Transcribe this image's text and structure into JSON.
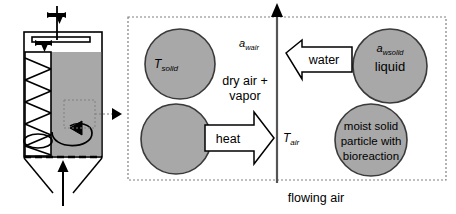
{
  "figure": {
    "type": "process-schematic",
    "bottom_caption": "flowing air"
  },
  "colors": {
    "particle_fill": "#a8a8a8",
    "vessel_fill": "#a8a8a8",
    "stroke": "#000000",
    "callout_dotted": "#808080",
    "panel_border": "#808080",
    "background": "#ffffff"
  },
  "vessel": {
    "name": "bioreactor-vessel",
    "has_screw_auger": true,
    "has_top_stirrer_arm": true,
    "has_conical_hopper": true,
    "has_air_inlet_arrow": true,
    "callout_box_label": "",
    "icons": [
      {
        "name": "motor-drive-icon",
        "position": "top-shaft"
      },
      {
        "name": "motor-drive-icon",
        "position": "arm-left-end"
      },
      {
        "name": "mixing-direction-arrow-icon",
        "position": "vessel-interior"
      },
      {
        "name": "callout-pointer-icon",
        "position": "right-of-vessel"
      },
      {
        "name": "air-inlet-arrow-icon",
        "position": "below-hopper"
      }
    ]
  },
  "panel": {
    "name": "magnified-transfer-panel",
    "border_style": "dotted",
    "axis": {
      "name": "flowing-air-axis",
      "orientation": "vertical",
      "arrow_direction": "up",
      "top_label": "a",
      "top_label_sub": "wair",
      "bottom_label": "T",
      "bottom_label_sub": "air"
    },
    "center_text": {
      "line1": "dry air +",
      "line2": "vapor"
    },
    "particles": [
      {
        "name": "particle-top-left",
        "label": "T",
        "label_sub": "solid",
        "label_style": "italic",
        "side": "left"
      },
      {
        "name": "particle-bottom-left",
        "label": "",
        "label_sub": "",
        "label_style": "none",
        "side": "left"
      },
      {
        "name": "particle-top-right-liquid",
        "label": "a",
        "label_sub": "wsolid",
        "label_style": "italic",
        "caption": "liquid",
        "side": "right"
      },
      {
        "name": "particle-bottom-right-moist-solid",
        "label": "",
        "label_sub": "",
        "caption_lines": [
          "moist solid",
          "particle with",
          "bioreaction"
        ],
        "side": "right"
      }
    ],
    "flow_arrows": [
      {
        "name": "water-flow-arrow",
        "label": "water",
        "direction": "left",
        "position": "upper"
      },
      {
        "name": "heat-flow-arrow",
        "label": "heat",
        "direction": "right",
        "position": "lower"
      }
    ]
  }
}
